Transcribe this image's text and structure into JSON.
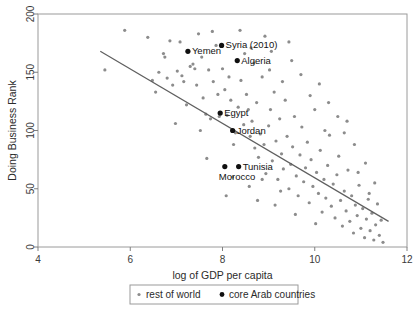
{
  "chart_data": {
    "type": "scatter",
    "title": "",
    "xlabel": "log of GDP per capita",
    "ylabel": "Doing Business Rank",
    "xlim": [
      4,
      12
    ],
    "ylim": [
      0,
      200
    ],
    "xticks": [
      4,
      6,
      8,
      10,
      12
    ],
    "yticks": [
      0,
      50,
      100,
      150,
      200
    ],
    "grid": false,
    "legend_position": "bottom-outside",
    "legend": [
      {
        "name": "rest of world",
        "color": "#8c8c8c",
        "marker": "dot-small"
      },
      {
        "name": "core Arab countries",
        "color": "#101010",
        "marker": "dot-large"
      }
    ],
    "trendline": {
      "label": "linear fit",
      "x": [
        5.35,
        11.6
      ],
      "y": [
        168,
        22
      ],
      "color": "#5f5f5f"
    },
    "series": [
      {
        "name": "core Arab countries",
        "color": "#101010",
        "points": [
          {
            "label": "Yemen",
            "x": 7.25,
            "y": 168,
            "label_dx": 4,
            "label_dy": 3
          },
          {
            "label": "Syria (2010)",
            "x": 7.98,
            "y": 173,
            "label_dx": 4,
            "label_dy": 3
          },
          {
            "label": "Algeria",
            "x": 8.32,
            "y": 160,
            "label_dx": 4,
            "label_dy": 3
          },
          {
            "label": "Egypt",
            "x": 7.95,
            "y": 115,
            "label_dx": 4,
            "label_dy": 3
          },
          {
            "label": "Jordan",
            "x": 8.22,
            "y": 100,
            "label_dx": 4,
            "label_dy": 3
          },
          {
            "label": "Tunisia",
            "x": 8.35,
            "y": 69,
            "label_dx": 4,
            "label_dy": 3
          },
          {
            "label": "Morocco",
            "x": 8.05,
            "y": 69,
            "label_dx": -6,
            "label_dy": 13
          }
        ]
      },
      {
        "name": "rest of world",
        "color": "#8c8c8c",
        "points": [
          {
            "x": 5.45,
            "y": 152
          },
          {
            "x": 5.88,
            "y": 186
          },
          {
            "x": 6.38,
            "y": 180
          },
          {
            "x": 6.62,
            "y": 150
          },
          {
            "x": 6.72,
            "y": 166
          },
          {
            "x": 6.75,
            "y": 163
          },
          {
            "x": 6.8,
            "y": 145
          },
          {
            "x": 6.86,
            "y": 177
          },
          {
            "x": 6.48,
            "y": 143
          },
          {
            "x": 6.55,
            "y": 133
          },
          {
            "x": 6.92,
            "y": 139
          },
          {
            "x": 7.02,
            "y": 151
          },
          {
            "x": 7.08,
            "y": 176
          },
          {
            "x": 7.12,
            "y": 147
          },
          {
            "x": 7.16,
            "y": 142
          },
          {
            "x": 7.22,
            "y": 122
          },
          {
            "x": 7.3,
            "y": 155
          },
          {
            "x": 7.36,
            "y": 157
          },
          {
            "x": 7.4,
            "y": 153
          },
          {
            "x": 7.44,
            "y": 139
          },
          {
            "x": 7.48,
            "y": 183
          },
          {
            "x": 7.52,
            "y": 100
          },
          {
            "x": 7.58,
            "y": 128
          },
          {
            "x": 7.64,
            "y": 114
          },
          {
            "x": 7.7,
            "y": 152
          },
          {
            "x": 7.74,
            "y": 110
          },
          {
            "x": 7.8,
            "y": 142
          },
          {
            "x": 7.86,
            "y": 173
          },
          {
            "x": 7.9,
            "y": 131
          },
          {
            "x": 7.93,
            "y": 112
          },
          {
            "x": 8.0,
            "y": 153
          },
          {
            "x": 8.05,
            "y": 135
          },
          {
            "x": 8.1,
            "y": 113
          },
          {
            "x": 8.14,
            "y": 146
          },
          {
            "x": 8.18,
            "y": 126
          },
          {
            "x": 8.24,
            "y": 88
          },
          {
            "x": 8.28,
            "y": 98
          },
          {
            "x": 8.34,
            "y": 120
          },
          {
            "x": 8.4,
            "y": 143
          },
          {
            "x": 8.46,
            "y": 105
          },
          {
            "x": 8.52,
            "y": 131
          },
          {
            "x": 8.56,
            "y": 118
          },
          {
            "x": 8.6,
            "y": 95
          },
          {
            "x": 8.64,
            "y": 108
          },
          {
            "x": 8.7,
            "y": 85
          },
          {
            "x": 8.74,
            "y": 124
          },
          {
            "x": 8.78,
            "y": 77
          },
          {
            "x": 8.82,
            "y": 97
          },
          {
            "x": 8.86,
            "y": 146
          },
          {
            "x": 8.9,
            "y": 88
          },
          {
            "x": 8.94,
            "y": 63
          },
          {
            "x": 9.0,
            "y": 104
          },
          {
            "x": 9.04,
            "y": 118
          },
          {
            "x": 9.08,
            "y": 74
          },
          {
            "x": 9.12,
            "y": 133
          },
          {
            "x": 9.16,
            "y": 91
          },
          {
            "x": 9.2,
            "y": 58
          },
          {
            "x": 9.24,
            "y": 110
          },
          {
            "x": 9.28,
            "y": 80
          },
          {
            "x": 9.32,
            "y": 67
          },
          {
            "x": 9.36,
            "y": 126
          },
          {
            "x": 9.4,
            "y": 95
          },
          {
            "x": 9.44,
            "y": 50
          },
          {
            "x": 9.48,
            "y": 71
          },
          {
            "x": 9.52,
            "y": 86
          },
          {
            "x": 9.56,
            "y": 112
          },
          {
            "x": 9.6,
            "y": 61
          },
          {
            "x": 9.64,
            "y": 44
          },
          {
            "x": 9.68,
            "y": 79
          },
          {
            "x": 9.72,
            "y": 103
          },
          {
            "x": 9.76,
            "y": 56
          },
          {
            "x": 9.8,
            "y": 68
          },
          {
            "x": 9.84,
            "y": 90
          },
          {
            "x": 9.88,
            "y": 38
          },
          {
            "x": 9.92,
            "y": 75
          },
          {
            "x": 9.96,
            "y": 52
          },
          {
            "x": 10.0,
            "y": 118
          },
          {
            "x": 10.04,
            "y": 64
          },
          {
            "x": 10.08,
            "y": 46
          },
          {
            "x": 10.12,
            "y": 83
          },
          {
            "x": 10.16,
            "y": 30
          },
          {
            "x": 10.2,
            "y": 58
          },
          {
            "x": 10.24,
            "y": 42
          },
          {
            "x": 10.28,
            "y": 70
          },
          {
            "x": 10.32,
            "y": 96
          },
          {
            "x": 10.36,
            "y": 35
          },
          {
            "x": 10.4,
            "y": 54
          },
          {
            "x": 10.44,
            "y": 25
          },
          {
            "x": 10.48,
            "y": 62
          },
          {
            "x": 10.52,
            "y": 78
          },
          {
            "x": 10.56,
            "y": 40
          },
          {
            "x": 10.6,
            "y": 18
          },
          {
            "x": 10.64,
            "y": 48
          },
          {
            "x": 10.68,
            "y": 31
          },
          {
            "x": 10.72,
            "y": 66
          },
          {
            "x": 10.76,
            "y": 22
          },
          {
            "x": 10.8,
            "y": 44
          },
          {
            "x": 10.84,
            "y": 12
          },
          {
            "x": 10.88,
            "y": 36
          },
          {
            "x": 10.92,
            "y": 27
          },
          {
            "x": 10.96,
            "y": 53
          },
          {
            "x": 11.0,
            "y": 16
          },
          {
            "x": 11.04,
            "y": 33
          },
          {
            "x": 11.08,
            "y": 8
          },
          {
            "x": 11.12,
            "y": 24
          },
          {
            "x": 11.16,
            "y": 41
          },
          {
            "x": 11.2,
            "y": 14
          },
          {
            "x": 11.24,
            "y": 29
          },
          {
            "x": 11.28,
            "y": 6
          },
          {
            "x": 11.32,
            "y": 19
          },
          {
            "x": 11.36,
            "y": 37
          },
          {
            "x": 11.4,
            "y": 10
          },
          {
            "x": 11.44,
            "y": 23
          },
          {
            "x": 11.48,
            "y": 4
          },
          {
            "x": 8.48,
            "y": 166
          },
          {
            "x": 8.68,
            "y": 158
          },
          {
            "x": 9.02,
            "y": 152
          },
          {
            "x": 9.3,
            "y": 142
          },
          {
            "x": 8.92,
            "y": 181
          },
          {
            "x": 9.5,
            "y": 160
          },
          {
            "x": 9.7,
            "y": 148
          },
          {
            "x": 8.38,
            "y": 186
          },
          {
            "x": 9.9,
            "y": 130
          },
          {
            "x": 10.3,
            "y": 124
          },
          {
            "x": 10.7,
            "y": 108
          },
          {
            "x": 10.1,
            "y": 140
          },
          {
            "x": 7.55,
            "y": 163
          },
          {
            "x": 7.78,
            "y": 185
          },
          {
            "x": 8.62,
            "y": 171
          },
          {
            "x": 6.98,
            "y": 106
          },
          {
            "x": 8.22,
            "y": 60
          },
          {
            "x": 8.58,
            "y": 52
          },
          {
            "x": 8.08,
            "y": 44
          },
          {
            "x": 8.76,
            "y": 40
          },
          {
            "x": 9.14,
            "y": 36
          },
          {
            "x": 9.58,
            "y": 28
          },
          {
            "x": 10.02,
            "y": 20
          },
          {
            "x": 7.66,
            "y": 76
          },
          {
            "x": 9.06,
            "y": 168
          },
          {
            "x": 9.44,
            "y": 176
          },
          {
            "x": 10.22,
            "y": 100
          },
          {
            "x": 10.86,
            "y": 88
          },
          {
            "x": 11.1,
            "y": 72
          },
          {
            "x": 10.5,
            "y": 112
          },
          {
            "x": 8.86,
            "y": 58
          },
          {
            "x": 9.26,
            "y": 48
          },
          {
            "x": 10.64,
            "y": 98
          },
          {
            "x": 11.3,
            "y": 55
          },
          {
            "x": 10.94,
            "y": 64
          },
          {
            "x": 11.18,
            "y": 46
          }
        ]
      }
    ]
  },
  "axes": {
    "x_title": "log of GDP per capita",
    "y_title": "Doing Business Rank",
    "x_tick_labels": [
      "4",
      "6",
      "8",
      "10",
      "12"
    ],
    "y_tick_labels": [
      "0",
      "50",
      "100",
      "150",
      "200"
    ]
  },
  "legend": {
    "rest_label": "rest of world",
    "arab_label": "core Arab countries"
  },
  "colors": {
    "rest_of_world": "#8c8c8c",
    "core_arab": "#101010",
    "trendline": "#5f5f5f",
    "frame": "#9a9a9a"
  }
}
